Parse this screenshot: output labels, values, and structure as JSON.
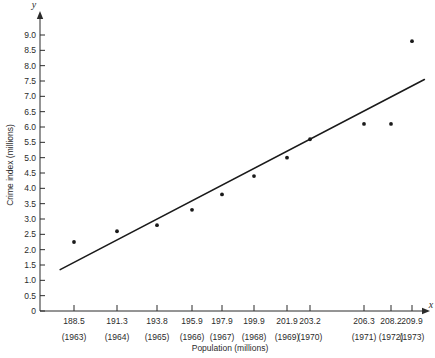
{
  "chart_data": {
    "type": "scatter",
    "title": "",
    "xlabel": "Population (millions)",
    "ylabel": "Crime index (millions)",
    "x_axis_var": "x",
    "y_axis_var": "y",
    "ylim": [
      0,
      9.0
    ],
    "y_tick_step": 0.5,
    "grid": false,
    "legend": null,
    "y_ticks": [
      "0",
      "0.5",
      "1.0",
      "1.5",
      "2.0",
      "2.5",
      "3.0",
      "3.5",
      "4.0",
      "4.5",
      "5.0",
      "5.5",
      "6.0",
      "6.5",
      "7.0",
      "7.5",
      "8.0",
      "8.5",
      "9.0"
    ],
    "x_ticks": [
      "188.5",
      "191.3",
      "193.8",
      "195.9",
      "197.9",
      "199.9",
      "201.9",
      "203.2",
      "206.3",
      "208.2",
      "209.9"
    ],
    "x_tick_sublabels": [
      "(1963)",
      "(1964)",
      "(1965)",
      "(1966)",
      "(1967)",
      "(1968)",
      "(1969)",
      "(1970)",
      "(1971)",
      "(1972)",
      "(1973)"
    ],
    "x": [
      188.5,
      191.3,
      193.8,
      195.9,
      197.9,
      199.9,
      201.9,
      203.2,
      206.3,
      208.2,
      209.9
    ],
    "values": [
      2.25,
      2.6,
      2.8,
      3.3,
      3.8,
      4.4,
      5.0,
      5.6,
      6.1,
      6.1,
      8.8
    ],
    "point_labels": [
      "1963",
      "1964",
      "1965",
      "1966",
      "1967",
      "1968",
      "1969",
      "1970",
      "1971",
      "1972",
      "1973"
    ],
    "trend_line": {
      "type": "linear-fit",
      "x_start": 187.6,
      "y_start": 1.35,
      "x_end": 210.9,
      "y_end": 7.55
    },
    "colors": {
      "axis": "#2b2b2b",
      "point": "#1a1a1a",
      "line": "#1a1a1a",
      "background": "#ffffff"
    }
  }
}
